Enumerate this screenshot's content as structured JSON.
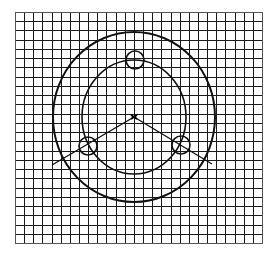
{
  "diagram": {
    "colors": {
      "background": "#ffffff",
      "grid": "#1a1a1a",
      "stroke": "#111111"
    },
    "grid": {
      "x0": 15,
      "y0": 12,
      "x1": 262,
      "y1": 243,
      "cols": 27,
      "rows": 25
    },
    "center": {
      "x": 134,
      "y": 117
    },
    "outer_circle": {
      "rx": 81,
      "ry": 85
    },
    "inner_circle": {
      "rx": 52,
      "ry": 57
    },
    "holes": [
      {
        "name": "top",
        "cx": 135,
        "cy": 60,
        "r": 9
      },
      {
        "name": "lower-left",
        "cx": 88,
        "cy": 146,
        "r": 9
      },
      {
        "name": "lower-right",
        "cx": 181,
        "cy": 145,
        "r": 9
      }
    ],
    "radial_lines": [
      {
        "name": "to-lower-left",
        "x1": 134,
        "y1": 117,
        "x2": 52,
        "y2": 165
      },
      {
        "name": "to-lower-right",
        "x1": 134,
        "y1": 117,
        "x2": 212,
        "y2": 164
      }
    ]
  }
}
